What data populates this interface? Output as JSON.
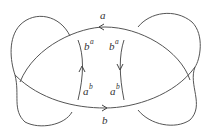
{
  "diagram": {
    "type": "curve-diagram",
    "line_color": "#555555",
    "background": "#ffffff",
    "labels": {
      "top_arc": "a",
      "bottom_arc": "b",
      "left_inner_top": {
        "base": "b",
        "sup": "a"
      },
      "left_inner_bottom": {
        "base": "a",
        "sup": "b"
      },
      "right_inner_top": {
        "base": "b",
        "sup": "a"
      },
      "right_inner_bottom": {
        "base": "a",
        "sup": "b"
      }
    },
    "arrows": {
      "top_arc": "left",
      "bottom_arc": "right",
      "left_inner": "up",
      "right_inner": "down"
    },
    "components": [
      {
        "name": "top-arc",
        "label": "a"
      },
      {
        "name": "bottom-arc",
        "label": "b"
      },
      {
        "name": "left-inner-arc",
        "labels": [
          "b^a",
          "a^b"
        ]
      },
      {
        "name": "right-inner-arc",
        "labels": [
          "b^a",
          "a^b"
        ]
      },
      {
        "name": "left-outer-loop"
      },
      {
        "name": "right-outer-loop"
      }
    ]
  }
}
